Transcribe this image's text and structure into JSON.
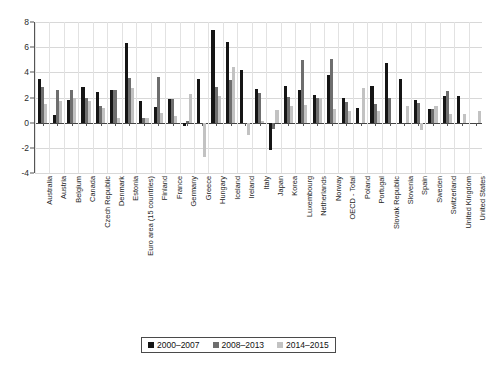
{
  "chart_data": {
    "type": "bar",
    "title": "",
    "subtitle": "",
    "xlabel": "",
    "ylabel": "",
    "ylim": [
      -4,
      8
    ],
    "yticks": [
      -4,
      -2,
      0,
      2,
      4,
      6,
      8
    ],
    "ytick_labels": [
      "-4",
      "-2",
      "0",
      "2",
      "4",
      "6",
      "8"
    ],
    "grid": true,
    "legend_position": "bottom",
    "categories": [
      "Australia",
      "Austria",
      "Belgium",
      "Canada",
      "Czech Republic",
      "Denmark",
      "Estonia",
      "Euro area (15 countries)",
      "Finland",
      "France",
      "Germany",
      "Greece",
      "Hungary",
      "Iceland",
      "Ireland",
      "Italy",
      "Japan",
      "Korea",
      "Luxembourg",
      "Netherlands",
      "Norway",
      "OECD - Total",
      "Poland",
      "Portugal",
      "Slovak Republic",
      "Slovenia",
      "Spain",
      "Sweden",
      "Switzerland",
      "United Kingdom",
      "United States"
    ],
    "series": [
      {
        "name": "2000–2007",
        "color": "#151515",
        "values": [
          3.5,
          0.6,
          1.8,
          2.8,
          2.4,
          2.6,
          6.35,
          1.75,
          1.25,
          1.9,
          -0.3,
          3.5,
          7.4,
          6.4,
          4.2,
          2.7,
          -2.2,
          2.95,
          2.6,
          2.2,
          3.8,
          2.0,
          1.2,
          2.9,
          4.75,
          3.5,
          1.8,
          1.1,
          2.15,
          2.15,
          0.0
        ]
      },
      {
        "name": "2008–2013",
        "color": "#6e6e6e",
        "values": [
          2.85,
          2.6,
          2.6,
          2.0,
          1.3,
          2.6,
          3.55,
          0.35,
          3.6,
          1.85,
          0.15,
          0.0,
          2.8,
          3.4,
          0.0,
          2.35,
          -0.5,
          2.05,
          5.0,
          2.0,
          5.05,
          1.65,
          0.0,
          1.45,
          2.0,
          0.0,
          1.55,
          1.05,
          2.5,
          0.0,
          0.0
        ]
      },
      {
        "name": "2014–2015",
        "color": "#c2c2c2",
        "values": [
          1.5,
          1.75,
          1.95,
          1.7,
          1.15,
          0.35,
          2.75,
          0.35,
          0.8,
          0.5,
          2.25,
          -2.7,
          2.1,
          4.4,
          -1.0,
          0.1,
          1.0,
          1.35,
          1.4,
          1.95,
          1.1,
          0.9,
          2.75,
          0.9,
          0.0,
          1.3,
          -0.55,
          1.35,
          0.7,
          0.65,
          0.95
        ]
      }
    ],
    "legend": [
      {
        "label": "2000–2007",
        "color": "#151515"
      },
      {
        "label": "2008–2013",
        "color": "#6e6e6e"
      },
      {
        "label": "2014–2015",
        "color": "#c2c2c2"
      }
    ]
  }
}
